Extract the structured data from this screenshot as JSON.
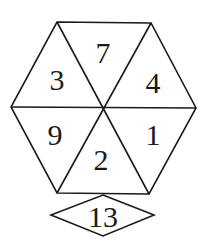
{
  "diagram": {
    "colors": {
      "stroke": "#1a1a1a",
      "background": "#ffffff",
      "text": "#1a1a1a"
    },
    "hexagon": {
      "triangles": [
        {
          "position": "top",
          "value": "7"
        },
        {
          "position": "upper-right",
          "value": "4"
        },
        {
          "position": "lower-right",
          "value": "1"
        },
        {
          "position": "bottom",
          "value": "2"
        },
        {
          "position": "lower-left",
          "value": "9"
        },
        {
          "position": "upper-left",
          "value": "3"
        }
      ]
    },
    "diamond": {
      "value": "13"
    }
  }
}
